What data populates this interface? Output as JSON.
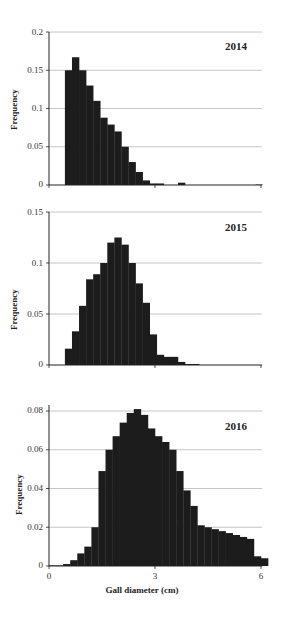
{
  "figure": {
    "xlabel": "Gall diameter (cm)",
    "x_ticks": [
      "0",
      "3",
      "6"
    ]
  },
  "panels": [
    {
      "year": "2014",
      "ylabel": "Frequency",
      "y_ticks": [
        "0.2",
        "0.15",
        "0.1",
        "0.05",
        "0"
      ]
    },
    {
      "year": "2015",
      "ylabel": "Frequency",
      "y_ticks": [
        "0.15",
        "0.1",
        "0.05",
        "0"
      ]
    },
    {
      "year": "2016",
      "ylabel": "Frequency",
      "y_ticks": [
        "0.08",
        "0.06",
        "0.04",
        "0.02",
        "0"
      ]
    }
  ],
  "chart_data": [
    {
      "type": "bar",
      "title": "2014",
      "xlabel": "",
      "ylabel": "Frequency",
      "xlim": [
        0,
        6.2
      ],
      "ylim": [
        0,
        0.2
      ],
      "y_ticks": [
        0,
        0.05,
        0.1,
        0.15,
        0.2
      ],
      "grid": true,
      "bin_start": 0.45,
      "bin_width": 0.2,
      "values": [
        0.15,
        0.167,
        0.15,
        0.13,
        0.11,
        0.088,
        0.079,
        0.07,
        0.05,
        0.03,
        0.017,
        0.006,
        0.002,
        0.002,
        0,
        0,
        0.003,
        0,
        0,
        0,
        0,
        0,
        0,
        0,
        0,
        0,
        0,
        0.0005
      ]
    },
    {
      "type": "bar",
      "title": "2015",
      "xlabel": "",
      "ylabel": "Frequency",
      "xlim": [
        0,
        6.2
      ],
      "ylim": [
        0,
        0.15
      ],
      "y_ticks": [
        0,
        0.05,
        0.1,
        0.15
      ],
      "grid": true,
      "bin_start": 0.45,
      "bin_width": 0.2,
      "values": [
        0.016,
        0.033,
        0.058,
        0.084,
        0.089,
        0.1,
        0.12,
        0.125,
        0.118,
        0.1,
        0.08,
        0.061,
        0.03,
        0.01,
        0.008,
        0.008,
        0.003,
        0.001,
        0.001
      ]
    },
    {
      "type": "bar",
      "title": "2016",
      "xlabel": "Gall diameter (cm)",
      "ylabel": "Frequency",
      "xlim": [
        0,
        6.2
      ],
      "ylim": [
        0,
        0.085
      ],
      "y_ticks": [
        0,
        0.02,
        0.04,
        0.06,
        0.08
      ],
      "x_ticks": [
        0,
        3,
        6
      ],
      "grid": true,
      "bin_start": 0.0,
      "bin_width": 0.2,
      "values": [
        0.0003,
        0.0003,
        0.001,
        0.003,
        0.0065,
        0.01,
        0.02,
        0.049,
        0.06,
        0.067,
        0.074,
        0.079,
        0.081,
        0.078,
        0.071,
        0.067,
        0.064,
        0.06,
        0.049,
        0.039,
        0.031,
        0.021,
        0.02,
        0.019,
        0.018,
        0.017,
        0.016,
        0.015,
        0.014,
        0.005,
        0.004
      ]
    }
  ]
}
